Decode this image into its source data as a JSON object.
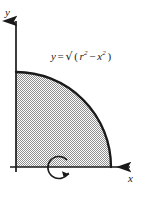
{
  "figure": {
    "background_color": "#ffffff",
    "ink_color": "#1a1a1a",
    "shading_color": "#9a9a9a",
    "equation": {
      "lhs": "y",
      "equals": "=",
      "radical_glyph": "√",
      "open_paren": "(",
      "radicand_first_base": "r",
      "radicand_first_exp": "2",
      "minus": "−",
      "radicand_second_base": "x",
      "radicand_second_exp": "2",
      "close_paren": ")",
      "full_text": "y = √(r² − x²)"
    },
    "axes": {
      "y_label": "y",
      "x_label": "x",
      "origin": {
        "x": 16,
        "y": 167
      },
      "x_axis_end": {
        "x": 136,
        "y": 167
      },
      "y_axis_top": {
        "x": 16,
        "y": 13
      }
    },
    "curve": {
      "type": "quarter-circle-arc",
      "radius_px": 95,
      "start_point": {
        "x": 16,
        "y": 72
      },
      "end_point": {
        "x": 111,
        "y": 167
      }
    },
    "region": {
      "name": "shaded-quarter-disk",
      "fill_pattern": "checkerboard-dither"
    },
    "rotation_arrow": {
      "name": "rotation-about-x-axis",
      "center": {
        "x": 61,
        "y": 167
      },
      "radius_px": 11,
      "direction": "counterclockwise-to-arrowhead"
    }
  }
}
